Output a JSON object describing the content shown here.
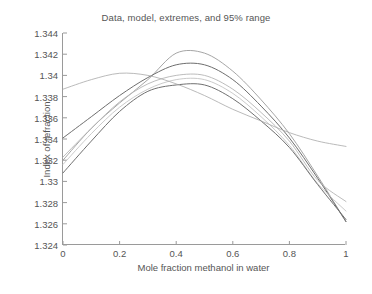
{
  "chart_data": {
    "type": "line",
    "title": "Data, model, extremes, and 95% range",
    "xlabel": "Mole fraction methanol in water",
    "ylabel": "Index of refraction",
    "xlim": [
      0,
      1
    ],
    "ylim": [
      1.324,
      1.344
    ],
    "xticks": [
      "0",
      "0.2",
      "0.4",
      "0.6",
      "0.8",
      "1"
    ],
    "xtick_values": [
      0,
      0.2,
      0.4,
      0.6,
      0.8,
      1
    ],
    "yticks": [
      "1.324",
      "1.326",
      "1.328",
      "1.33",
      "1.332",
      "1.334",
      "1.336",
      "1.338",
      "1.34",
      "1.342",
      "1.344"
    ],
    "ytick_values": [
      1.324,
      1.326,
      1.328,
      1.33,
      1.332,
      1.334,
      1.336,
      1.338,
      1.34,
      1.342,
      1.344
    ],
    "grid": false,
    "legend": "none",
    "x": [
      0,
      0.1,
      0.2,
      0.3,
      0.4,
      0.5,
      0.6,
      0.7,
      0.8,
      0.9,
      1
    ],
    "series": [
      {
        "name": "upper extreme",
        "color": "#9b9b9b",
        "width": 0.9,
        "values": [
          1.332,
          1.335,
          1.3374,
          1.3396,
          1.3421,
          1.3421,
          1.3404,
          1.3377,
          1.3345,
          1.3305,
          1.3262
        ]
      },
      {
        "name": "model",
        "color": "#6e6e6e",
        "width": 1.0,
        "values": [
          1.3341,
          1.3361,
          1.3381,
          1.3398,
          1.341,
          1.341,
          1.3396,
          1.3371,
          1.3341,
          1.3303,
          1.3262
        ]
      },
      {
        "name": "upper 95% bound",
        "color": "#b4b4b4",
        "width": 0.9,
        "values": [
          1.3323,
          1.335,
          1.3375,
          1.3392,
          1.34,
          1.34,
          1.3387,
          1.3365,
          1.3338,
          1.3301,
          1.3281
        ]
      },
      {
        "name": "lower 95% bound",
        "color": "#c4c4c4",
        "width": 0.9,
        "values": [
          1.3316,
          1.3345,
          1.337,
          1.3387,
          1.3396,
          1.3396,
          1.3383,
          1.3361,
          1.3334,
          1.3298,
          1.3272
        ]
      },
      {
        "name": "lower extreme",
        "color": "#707070",
        "width": 1.0,
        "values": [
          1.3308,
          1.3338,
          1.3366,
          1.3385,
          1.3391,
          1.3391,
          1.3378,
          1.3357,
          1.3332,
          1.3297,
          1.3264
        ]
      },
      {
        "name": "data",
        "color": "#a8a8a8",
        "width": 0.8,
        "values": [
          1.3387,
          1.3396,
          1.3402,
          1.34,
          1.3392,
          1.3381,
          1.3368,
          1.3357,
          1.3346,
          1.3338,
          1.3333
        ]
      }
    ]
  },
  "caption": ""
}
